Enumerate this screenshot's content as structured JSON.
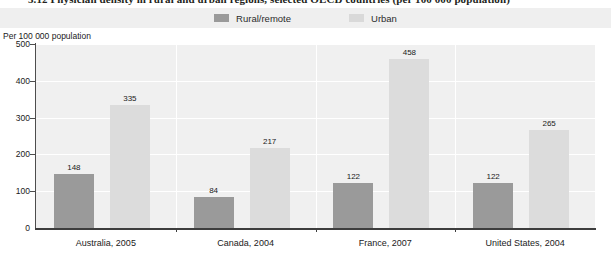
{
  "title": {
    "text": "3.12 Physician density in rural and urban regions, selected OECD countries (per 100 000 population)"
  },
  "legend": {
    "position": "top-center",
    "items": [
      {
        "label": "Rural/remote",
        "color": "#9a9a9a",
        "icon": "legend-swatch"
      },
      {
        "label": "Urban",
        "color": "#dcdcdc",
        "icon": "legend-swatch"
      }
    ]
  },
  "axis": {
    "y_title": "Per 100 000 population",
    "y_ticks": [
      "500",
      "400",
      "300",
      "200",
      "100",
      "0"
    ]
  },
  "colors": {
    "rural": "#9a9a9a",
    "urban": "#dcdcdc",
    "plot_background": "#f0f0f0",
    "gridline": "#ffffff",
    "axis": "#3d3d3d",
    "legend_band": "#efefef"
  },
  "chart_data": {
    "type": "bar",
    "title": "3.12 Physician density in rural and urban regions, selected OECD countries (per 100 000 population)",
    "xlabel": "",
    "ylabel": "Per 100 000 population",
    "ylim": [
      0,
      500
    ],
    "yticks": [
      0,
      100,
      200,
      300,
      400,
      500
    ],
    "grid": true,
    "legend_position": "top-center",
    "categories": [
      "Australia, 2005",
      "Canada, 2004",
      "France, 2007",
      "United States, 2004"
    ],
    "series": [
      {
        "name": "Rural/remote",
        "color": "#9a9a9a",
        "values": [
          148,
          84,
          122,
          122
        ]
      },
      {
        "name": "Urban",
        "color": "#dcdcdc",
        "values": [
          335,
          217,
          458,
          265
        ]
      }
    ]
  }
}
